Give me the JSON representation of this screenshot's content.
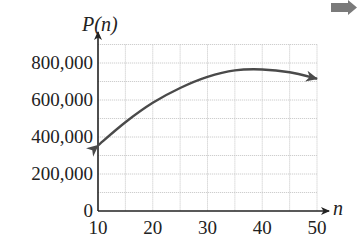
{
  "chart_data": {
    "type": "line",
    "title": "",
    "xlabel": "n",
    "ylabel": "P(n)",
    "x_ticks": [
      10,
      20,
      30,
      40,
      50
    ],
    "x_tick_labels": [
      "10",
      "20",
      "30",
      "40",
      "50"
    ],
    "y_ticks": [
      0,
      200000,
      400000,
      600000,
      800000
    ],
    "y_tick_labels": [
      "0",
      "200,000",
      "400,000",
      "600,000",
      "800,000"
    ],
    "xlim": [
      10,
      50
    ],
    "ylim": [
      0,
      900000
    ],
    "grid": true,
    "grid_x_step": 5,
    "grid_y_step": 100000,
    "legend": null,
    "arrows_on_curve_ends": true,
    "x": [
      10,
      15,
      20,
      25,
      30,
      35,
      40,
      45,
      50
    ],
    "series": [
      {
        "name": "P(n)",
        "color": "#4a4a4a",
        "values": [
          355000,
          480000,
          585000,
          665000,
          725000,
          760000,
          765000,
          750000,
          715000
        ]
      }
    ]
  },
  "labels": {
    "y_axis_title": "P(n)",
    "x_axis_title": "n"
  },
  "decorations": {
    "corner_arrow_color": "#7a7a7a"
  }
}
